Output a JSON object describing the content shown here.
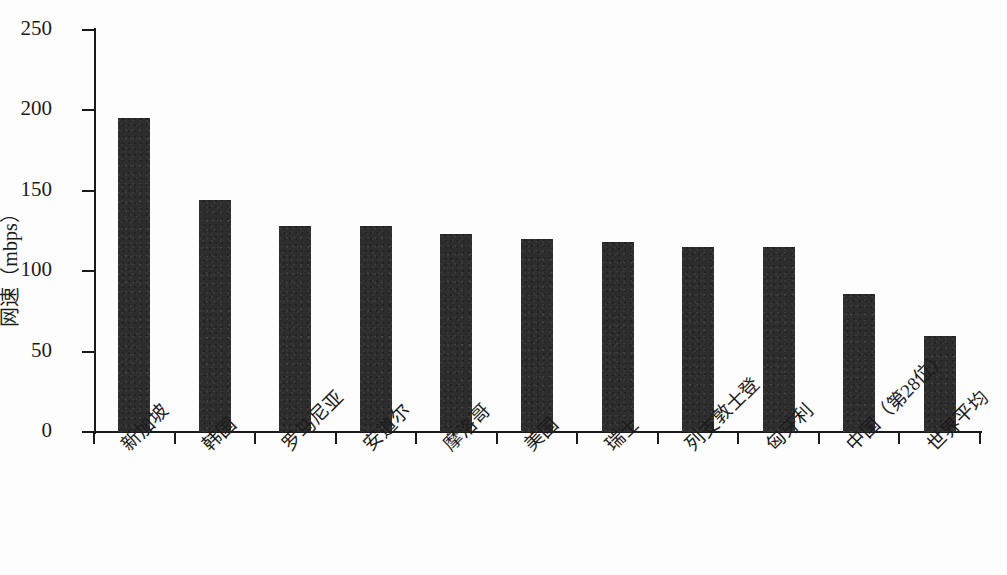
{
  "chart_data": {
    "type": "bar",
    "title": "",
    "xlabel": "",
    "ylabel": "网速（mbps）",
    "ylim": [
      0,
      250
    ],
    "ytick_labels": [
      "250",
      "200",
      "150",
      "100",
      "50",
      "0"
    ],
    "ytick_values": [
      250,
      200,
      150,
      100,
      50,
      0
    ],
    "grid": false,
    "legend": null,
    "bar_color": "#2d2d2d",
    "axis_color": "#1a1a1a",
    "background_color": "#fdfdfd",
    "categories": [
      "新加坡",
      "韩国",
      "罗马尼亚",
      "安道尔",
      "摩洛哥",
      "美国",
      "瑞士",
      "列支敦士登",
      "匈牙利",
      "中国（第28位）",
      "世界平均"
    ],
    "values": [
      195,
      144,
      128,
      128,
      123,
      120,
      118,
      115,
      115,
      86,
      60
    ],
    "series": [
      {
        "name": "网速",
        "values": [
          195,
          144,
          128,
          128,
          123,
          120,
          118,
          115,
          115,
          86,
          60
        ]
      }
    ]
  }
}
